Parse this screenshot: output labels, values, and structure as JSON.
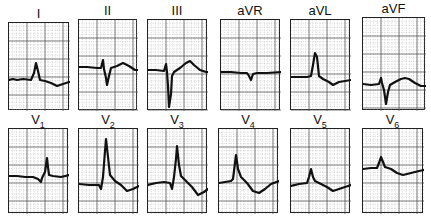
{
  "figure": {
    "rows": [
      {
        "leads": [
          {
            "label": "I",
            "x": 8,
            "y": 22,
            "w": 61,
            "h": 88,
            "trace": "M0,57 L4,56 L8,57 L14,56 L22,57 L25,50 L27,40 L29,48 L31,57 L36,58 L42,60 L48,63 L54,61 L60,59 L61,59"
          },
          {
            "label": "II",
            "x": 78,
            "y": 19,
            "w": 59,
            "h": 91,
            "trace": "M0,47 L8,47 L18,48 L22,48 L24,40 L25,49 L27,58 L28,65 L30,56 L32,48 L38,46 L44,43 L50,46 L56,50 L59,50"
          },
          {
            "label": "III",
            "x": 147,
            "y": 19,
            "w": 60,
            "h": 91,
            "trace": "M0,50 L8,50 L16,51 L18,44 L19,52 L20,66 L21,87 L23,74 L24,56 L26,52 L32,48 L38,43 L42,41 L46,45 L52,50 L58,52 L60,52"
          },
          {
            "label": "aVR",
            "x": 220,
            "y": 19,
            "w": 60,
            "h": 91,
            "trace": "M0,52 L10,52 L20,53 L26,53 L28,56 L30,60 L32,54 L36,53 L46,53 L60,52"
          },
          {
            "label": "aVL",
            "x": 290,
            "y": 19,
            "w": 60,
            "h": 91,
            "trace": "M0,57 L8,57 L16,57 L20,56 L22,45 L24,33 L26,37 L28,56 L32,59 L38,62 L42,65 L48,62 L54,61 L60,60"
          },
          {
            "label": "aVF",
            "x": 362,
            "y": 17,
            "w": 63,
            "h": 93,
            "trace": "M0,66 L8,67 L16,66 L18,60 L19,65 L21,72 L23,86 L25,74 L27,67 L32,64 L38,61 L42,60 L46,61 L52,65 L58,68 L63,68"
          }
        ]
      },
      {
        "leads": [
          {
            "label": "V",
            "sub": "1",
            "x": 8,
            "y": 128,
            "w": 60,
            "h": 85,
            "trace": "M0,47 L8,47 L16,48 L24,48 L29,50 L32,53 L33,49 L36,43 L38,29 L39,38 L40,46 L44,47 L52,48 L60,46"
          },
          {
            "label": "V",
            "sub": "2",
            "x": 78,
            "y": 128,
            "w": 60,
            "h": 85,
            "trace": "M0,55 L10,56 L20,56 L22,60 L24,48 L26,22 L27,10 L29,28 L31,46 L36,52 L42,56 L48,62 L54,60 L60,57"
          },
          {
            "label": "V",
            "sub": "3",
            "x": 147,
            "y": 128,
            "w": 60,
            "h": 85,
            "trace": "M0,56 L8,54 L16,53 L22,54 L24,60 L26,48 L28,30 L29,17 L31,36 L33,47 L38,52 L44,58 L50,66 L56,63 L60,60"
          },
          {
            "label": "V",
            "sub": "4",
            "x": 218,
            "y": 128,
            "w": 60,
            "h": 85,
            "trace": "M0,54 L6,53 L12,52 L14,50 L16,34 L17,26 L19,40 L22,48 L28,54 L34,62 L40,64 L46,60 L52,55 L60,52"
          },
          {
            "label": "V",
            "sub": "5",
            "x": 290,
            "y": 128,
            "w": 60,
            "h": 85,
            "trace": "M0,57 L8,55 L16,54 L18,48 L20,40 L22,48 L24,52 L30,55 L36,58 L42,62 L48,60 L54,58 L60,56"
          },
          {
            "label": "V",
            "sub": "6",
            "x": 362,
            "y": 128,
            "w": 61,
            "h": 85,
            "trace": "M0,40 L8,39 L14,39 L16,34 L18,28 L20,33 L22,38 L28,40 L34,44 L40,46 L48,44 L56,42 L61,41"
          }
        ]
      }
    ]
  },
  "colors": {
    "trace": "#111111",
    "grid_major": "#4a4a4a",
    "grid_minor": "#9a9a9a",
    "background": "#ffffff"
  }
}
